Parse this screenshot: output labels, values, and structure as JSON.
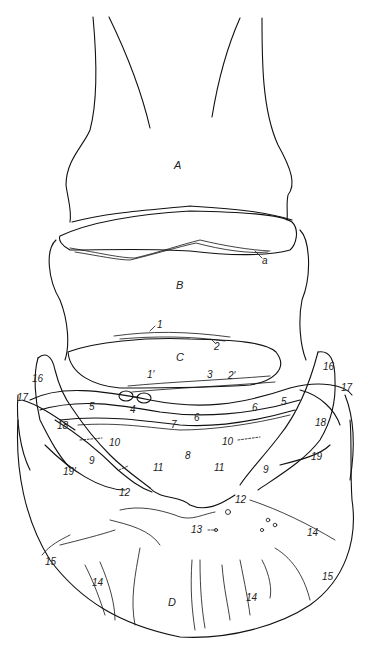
{
  "figure": {
    "type": "anatomical line drawing",
    "background": "#ffffff",
    "ink_color": "#111111",
    "regions": [
      {
        "id": "A",
        "label": "A"
      },
      {
        "id": "B",
        "label": "B"
      },
      {
        "id": "C",
        "label": "C"
      },
      {
        "id": "D",
        "label": "D"
      }
    ],
    "labels": {
      "A": "A",
      "B": "B",
      "C": "C",
      "D": "D",
      "a": "a",
      "n1": "1",
      "n1p": "1′",
      "n2": "2",
      "n2p": "2′",
      "n3": "3",
      "n4": "4",
      "n5_left": "5",
      "n5_right": "5",
      "n6_left": "6",
      "n6_right": "6",
      "n7": "7",
      "n8": "8",
      "n9_left": "9",
      "n9_right": "9",
      "n10_left": "10",
      "n10_right": "10",
      "n11_left": "11",
      "n11_right": "11",
      "n12_left": "12",
      "n12_right": "12",
      "n13": "13",
      "n14_a": "14",
      "n14_b": "14",
      "n14_c": "14",
      "n14_d": "14",
      "n15_left": "15",
      "n15_right": "15",
      "n16_left": "16",
      "n16_right": "16",
      "n17_left": "17",
      "n17_right": "17",
      "n18_left": "18",
      "n18_right": "18",
      "n19_left": "19′",
      "n19_right": "19"
    }
  }
}
